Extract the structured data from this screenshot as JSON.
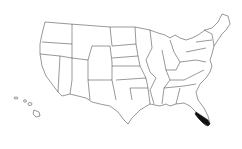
{
  "map": {
    "type": "us-states-outline",
    "highlighted_region": "South Florida",
    "highlight_color": "#111111",
    "outline_color": "#333333",
    "background_color": "#ffffff"
  }
}
